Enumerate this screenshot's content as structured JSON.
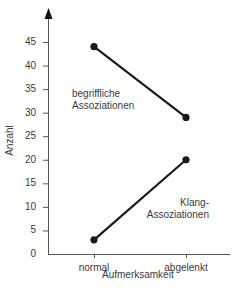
{
  "chart_data": {
    "type": "line",
    "title": "",
    "xlabel": "Aufmerksamkeit",
    "ylabel": "Anzahl",
    "categories": [
      "normal",
      "abgelenkt"
    ],
    "series": [
      {
        "name": "begriffliche Assoziationen",
        "label_lines": [
          "begriffliche",
          "Assoziationen"
        ],
        "values": [
          44,
          29
        ]
      },
      {
        "name": "Klang-Assoziationen",
        "label_lines": [
          "Klang-",
          "Assoziationen"
        ],
        "values": [
          3,
          20
        ]
      }
    ],
    "yticks": [
      "0",
      "5",
      "10",
      "15",
      "20",
      "25",
      "30",
      "35",
      "40",
      "45"
    ],
    "ylim": [
      0,
      48
    ],
    "grid": false,
    "legend": "inline labels",
    "colors": {
      "line": "#1a1a1a",
      "axis": "#555555",
      "text": "#3a3a3a"
    }
  }
}
